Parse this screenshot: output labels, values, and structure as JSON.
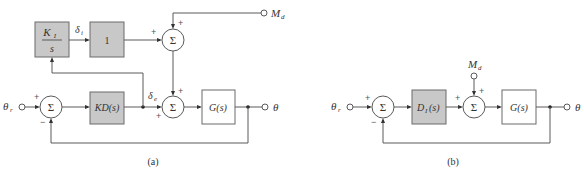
{
  "diagram_a": {
    "caption": "(a)",
    "input_label": "θ",
    "input_sub": "r",
    "output_label": "θ",
    "disturbance_label": "M",
    "disturbance_sub": "d",
    "integrator_num": "K",
    "integrator_num_sub": "I",
    "integrator_den": "s",
    "unity_block": "1",
    "controller_block": "KD(s)",
    "plant_block": "G(s)",
    "delta_i_label": "δ",
    "delta_i_sub": "i",
    "delta_e_label": "δ",
    "delta_e_sub": "e",
    "sum_symbol": "Σ",
    "signs": {
      "left_sum_in": "+",
      "left_sum_fb": "−",
      "top_sum_left": "+",
      "top_sum_top": "+",
      "bottom_sum_left": "+",
      "bottom_sum_top": "+"
    }
  },
  "diagram_b": {
    "caption": "(b)",
    "input_label": "θ",
    "input_sub": "r",
    "output_label": "θ",
    "disturbance_label": "M",
    "disturbance_sub": "d",
    "controller_block": "D",
    "controller_sub": "I",
    "controller_arg": "(s)",
    "plant_block": "G(s)",
    "sum_symbol": "Σ",
    "signs": {
      "left_sum_in": "+",
      "left_sum_fb": "−",
      "right_sum_left": "+",
      "right_sum_top": "+"
    }
  }
}
